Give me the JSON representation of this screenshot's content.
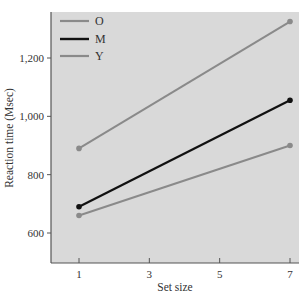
{
  "chart_data": {
    "type": "line",
    "title": "",
    "xlabel": "Set size",
    "ylabel": "Reaction time (Msec)",
    "x": [
      1,
      7
    ],
    "xticks": [
      1,
      3,
      5,
      7
    ],
    "yticks": [
      600,
      800,
      1000,
      1200
    ],
    "ytick_labels": [
      "600",
      "800",
      "1,000",
      "1,200"
    ],
    "xlim": [
      0.25,
      7.25
    ],
    "ylim": [
      500,
      1355
    ],
    "grid": false,
    "legend_position": "upper-left",
    "series": [
      {
        "name": "O",
        "values": [
          890,
          1325
        ],
        "color": "#8a8a8a"
      },
      {
        "name": "M",
        "values": [
          690,
          1055
        ],
        "color": "#111111"
      },
      {
        "name": "Y",
        "values": [
          660,
          900
        ],
        "color": "#8a8a8a"
      }
    ]
  },
  "colors": {
    "plot_background": "#d9d9d9",
    "axis": "#555555"
  }
}
